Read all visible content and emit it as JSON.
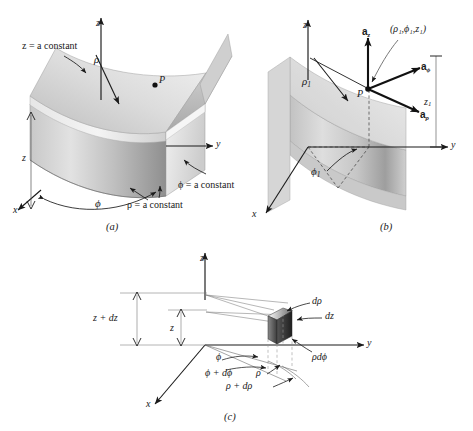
{
  "figure": {
    "background": "#ffffff",
    "ink": "#1a1a1a",
    "surface_light": "#eaeaea",
    "surface_mid": "#c4c4c4",
    "surface_dark": "#9a9a9a"
  },
  "panels": [
    {
      "id": "a",
      "caption": "(a)",
      "description": "Three mutually perpendicular surfaces of the cylindrical coordinate system",
      "axes": {
        "z": "z",
        "y": "y",
        "x": "x"
      },
      "labels": {
        "z_const": "z = a constant",
        "phi_const": "ϕ = a constant",
        "rho_const": "ρ = a constant",
        "rho": "ρ",
        "z_height": "z",
        "phi": "ϕ",
        "point": "P"
      }
    },
    {
      "id": "b",
      "caption": "(b)",
      "description": "The three unit vectors of the cylindrical coordinate system",
      "axes": {
        "z": "z",
        "y": "y",
        "x": "x"
      },
      "labels": {
        "coords": "(ρ₁,ϕ₁,z₁)",
        "rho1": "ρ₁",
        "phi1": "ϕ₁",
        "z1": "z₁",
        "point": "P",
        "a_z": "a_z",
        "a_phi": "a_ϕ",
        "a_rho": "a_ρ"
      }
    },
    {
      "id": "c",
      "caption": "(c)",
      "description": "Differential volume element in cylindrical coordinates",
      "axes": {
        "z": "z",
        "y": "y",
        "x": "x"
      },
      "labels": {
        "z_plus_dz": "z + dz",
        "z": "z",
        "d_rho": "dρ",
        "dz": "dz",
        "rho_d_phi": "ρdϕ",
        "phi": "ϕ",
        "phi_plus_dphi": "ϕ + dϕ",
        "rho": "ρ",
        "rho_plus_drho": "ρ + dρ"
      }
    }
  ]
}
